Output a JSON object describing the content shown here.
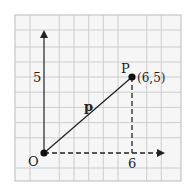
{
  "diagram": {
    "type": "vector-on-grid",
    "origin_label": "O",
    "point_label": "P",
    "point_coords_label": "(6,5)",
    "vector_label": "p",
    "x_tick_label": "6",
    "y_tick_label": "5",
    "point": {
      "x": 6,
      "y": 5
    },
    "grid": {
      "columns": 11,
      "rows": 11
    },
    "colors": {
      "grid": "#b8b8b8",
      "axis": "#222222",
      "background": "#f4f4f4"
    }
  }
}
